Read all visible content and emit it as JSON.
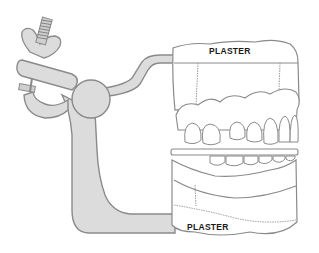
{
  "diagram": {
    "labels": {
      "top_plaster": "PLASTER",
      "bottom_plaster": "PLASTER"
    },
    "colors": {
      "metal_fill": "#dcdcdc",
      "outline": "#8a8a8a",
      "background": "#ffffff",
      "text": "#1a1a1a"
    }
  }
}
